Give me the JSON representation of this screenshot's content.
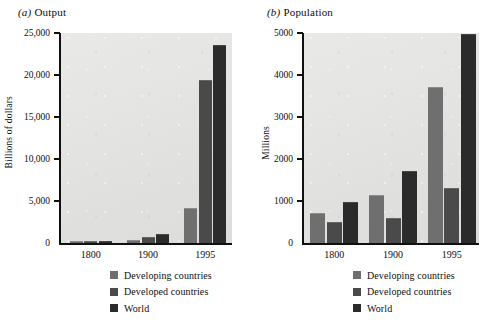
{
  "figure": {
    "background": "#ffffff",
    "plot_background": "#e3e3e1"
  },
  "series_colors": [
    "#6f6f6f",
    "#4a4a4a",
    "#2b2b2b"
  ],
  "legend": {
    "entries": [
      {
        "label": "Developing countries",
        "color": "#6f6f6f"
      },
      {
        "label": "Developed countries",
        "color": "#4a4a4a"
      },
      {
        "label": "World",
        "color": "#2b2b2b"
      }
    ]
  },
  "panels": [
    {
      "tag": "(a)",
      "title": "Output",
      "ylabel": "Billions of dollars",
      "ytick_labels": [
        "0",
        "5,000",
        "10,000",
        "15,000",
        "20,000",
        "25,000"
      ],
      "xtick_labels": [
        "1800",
        "1900",
        "1995"
      ]
    },
    {
      "tag": "(b)",
      "title": "Population",
      "ylabel": "Millions",
      "ytick_labels": [
        "0",
        "1000",
        "2000",
        "3000",
        "4000",
        "5000"
      ],
      "xtick_labels": [
        "1800",
        "1900",
        "1995"
      ]
    }
  ],
  "chart_data": [
    {
      "type": "bar",
      "title": "(a) Output",
      "xlabel": "",
      "ylabel": "Billions of dollars",
      "categories": [
        "1800",
        "1900",
        "1995"
      ],
      "ylim": [
        0,
        25000
      ],
      "yticks": [
        0,
        5000,
        10000,
        15000,
        20000,
        25000
      ],
      "grid": false,
      "legend_position": "below",
      "series": [
        {
          "name": "Developing countries",
          "color": "#6f6f6f",
          "values": [
            70,
            200,
            4100
          ]
        },
        {
          "name": "Developed countries",
          "color": "#4a4a4a",
          "values": [
            100,
            600,
            19300
          ]
        },
        {
          "name": "World",
          "color": "#2b2b2b",
          "values": [
            170,
            900,
            23400
          ]
        }
      ]
    },
    {
      "type": "bar",
      "title": "(b) Population",
      "xlabel": "",
      "ylabel": "Millions",
      "categories": [
        "1800",
        "1900",
        "1995"
      ],
      "ylim": [
        0,
        5000
      ],
      "yticks": [
        0,
        1000,
        2000,
        3000,
        4000,
        5000
      ],
      "grid": false,
      "legend_position": "below",
      "series": [
        {
          "name": "Developing countries",
          "color": "#6f6f6f",
          "values": [
            700,
            1110,
            3700
          ]
        },
        {
          "name": "Developed countries",
          "color": "#4a4a4a",
          "values": [
            480,
            570,
            1280
          ]
        },
        {
          "name": "World",
          "color": "#2b2b2b",
          "values": [
            950,
            1700,
            4950
          ]
        }
      ]
    }
  ]
}
